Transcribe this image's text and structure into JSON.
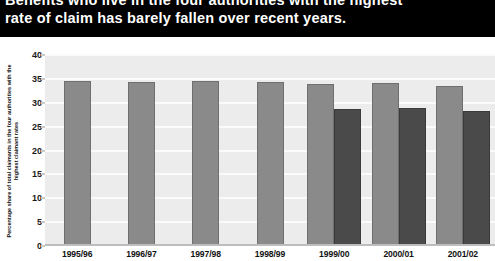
{
  "header": {
    "title_lines": [
      "Benefits who live in the four authorities with the highest",
      "rate of claim has barely fallen over recent years."
    ],
    "background_color": "#000000",
    "text_color": "#ffffff"
  },
  "legend": {
    "position": "top-right",
    "entries": [
      {
        "label": "Working age",
        "color": "#8a8a8a",
        "icon": "legend-swatch-icon"
      },
      {
        "label": "Pensioners",
        "color": "#4a4a4a",
        "icon": "legend-swatch-icon"
      }
    ]
  },
  "colors": {
    "working_age": "#8a8a8a",
    "pensioners": "#4a4a4a",
    "plot_background": "#ececec",
    "gridline": "#fbfbfb",
    "axis_text": "#111111"
  },
  "chart_data": {
    "type": "bar",
    "title": "Benefits who live in the four authorities with the highest rate of claim has barely fallen over recent years.",
    "subtitle": "",
    "xlabel": "",
    "ylabel": "Percentage share of total claimants in the four authorities with the highest claimant rates",
    "ylim": [
      0,
      40
    ],
    "yticks": [
      0,
      5,
      10,
      15,
      20,
      25,
      30,
      35,
      40
    ],
    "ytick_labels": [
      "0",
      "5",
      "10",
      "15",
      "20",
      "25",
      "30",
      "35",
      "40"
    ],
    "grid": true,
    "legend_position": "top-right",
    "categories": [
      "1995/96",
      "1996/97",
      "1997/98",
      "1998/99",
      "1999/00",
      "2000/01",
      "2001/02"
    ],
    "series": [
      {
        "name": "Working age",
        "color": "#8a8a8a",
        "values": [
          34.5,
          34.3,
          34.6,
          34.4,
          34.0,
          34.2,
          33.5
        ]
      },
      {
        "name": "Pensioners",
        "color": "#4a4a4a",
        "values": [
          null,
          null,
          null,
          null,
          28.7,
          28.8,
          28.3
        ]
      }
    ]
  }
}
